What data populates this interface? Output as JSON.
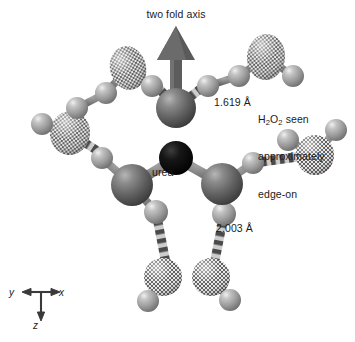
{
  "figure": {
    "kind": "molecular-structure-diagram",
    "background": "#ffffff",
    "labels": {
      "two_fold_axis": "two fold axis",
      "urea": "urea",
      "distance_o_h": "1.619 Å",
      "distance_n_h": "2.003 Å",
      "h2o2_note_line1_pre": "H",
      "h2o2_note_line1_sub1": "2",
      "h2o2_note_line1_mid": "O",
      "h2o2_note_line1_sub2": "2",
      "h2o2_note_line1_post": " seen",
      "h2o2_note_line2": "approximately",
      "h2o2_note_line3": "edge-on"
    },
    "axis_triad": {
      "x_label": "x",
      "y_label": "y",
      "z_label": "z"
    },
    "colors": {
      "atom_carbon": "#0a0a0a",
      "atom_heavy_dark": "#5a5a5a",
      "atom_hydrogen": "#9a9a9a",
      "atom_peroxide_oxygen": "#8d8d8d",
      "bond_solid": "#6e6e6e",
      "bond_dashed_dark": "#4f4f4f",
      "bond_dashed_light": "#c9c9c9",
      "arrow": "#5c5c5c",
      "text": "#1b1b1b"
    },
    "atoms": [
      {
        "id": "C1",
        "element": "C",
        "role": "urea-carbon",
        "style": "black",
        "cx": 176,
        "cy": 158,
        "r": 17
      },
      {
        "id": "O1",
        "element": "O",
        "role": "urea-oxygen",
        "style": "dark",
        "cx": 176,
        "cy": 108,
        "r": 20
      },
      {
        "id": "N1",
        "element": "N",
        "role": "urea-nitrogen-left",
        "style": "dark",
        "cx": 132,
        "cy": 185,
        "r": 21
      },
      {
        "id": "N2",
        "element": "N",
        "role": "urea-nitrogen-right",
        "style": "dark",
        "cx": 222,
        "cy": 184,
        "r": 21
      },
      {
        "id": "Op1a",
        "element": "O",
        "role": "peroxide-oxygen",
        "style": "checkered",
        "cx": 128,
        "cy": 68,
        "rx": 18,
        "ry": 22,
        "rot": -14
      },
      {
        "id": "Op1b",
        "element": "O",
        "role": "peroxide-oxygen",
        "style": "checkered",
        "cx": 70,
        "cy": 133,
        "rx": 20,
        "ry": 22,
        "rot": 8
      },
      {
        "id": "Op2a",
        "element": "O",
        "role": "peroxide-oxygen",
        "style": "checkered",
        "cx": 266,
        "cy": 57,
        "rx": 19,
        "ry": 23,
        "rot": 6
      },
      {
        "id": "Op3a",
        "element": "O",
        "role": "peroxide-oxygen",
        "style": "checkered",
        "cx": 315,
        "cy": 155,
        "rx": 19,
        "ry": 20,
        "rot": 0
      },
      {
        "id": "Op4a",
        "element": "O",
        "role": "peroxide-oxygen",
        "style": "checkered",
        "cx": 163,
        "cy": 277,
        "rx": 19,
        "ry": 19,
        "rot": 0
      },
      {
        "id": "Op4b",
        "element": "O",
        "role": "peroxide-oxygen",
        "style": "checkered",
        "cx": 211,
        "cy": 277,
        "rx": 19,
        "ry": 19,
        "rot": 0
      },
      {
        "id": "H1",
        "element": "H",
        "style": "light",
        "cx": 152,
        "cy": 86,
        "r": 11
      },
      {
        "id": "H2",
        "element": "H",
        "style": "light",
        "cx": 106,
        "cy": 93,
        "r": 11
      },
      {
        "id": "H3",
        "element": "H",
        "style": "light",
        "cx": 77,
        "cy": 108,
        "r": 11
      },
      {
        "id": "H4",
        "element": "H",
        "style": "light",
        "cx": 42,
        "cy": 124,
        "r": 11
      },
      {
        "id": "H5",
        "element": "H",
        "style": "light",
        "cx": 102,
        "cy": 158,
        "r": 11
      },
      {
        "id": "H6",
        "element": "H",
        "style": "light",
        "cx": 208,
        "cy": 86,
        "r": 11
      },
      {
        "id": "H7",
        "element": "H",
        "style": "light",
        "cx": 239,
        "cy": 76,
        "r": 11
      },
      {
        "id": "H8",
        "element": "H",
        "style": "light",
        "cx": 293,
        "cy": 76,
        "r": 11
      },
      {
        "id": "H9",
        "element": "H",
        "style": "light",
        "cx": 288,
        "cy": 140,
        "r": 11
      },
      {
        "id": "H10",
        "element": "H",
        "style": "light",
        "cx": 336,
        "cy": 130,
        "r": 11
      },
      {
        "id": "H11",
        "element": "H",
        "style": "light",
        "cx": 253,
        "cy": 163,
        "r": 11
      },
      {
        "id": "H12",
        "element": "H",
        "style": "light",
        "cx": 156,
        "cy": 212,
        "r": 12
      },
      {
        "id": "H13",
        "element": "H",
        "style": "light",
        "cx": 224,
        "cy": 214,
        "r": 12
      },
      {
        "id": "H14",
        "element": "H",
        "style": "light",
        "cx": 148,
        "cy": 301,
        "r": 11
      },
      {
        "id": "H15",
        "element": "H",
        "style": "light",
        "cx": 230,
        "cy": 300,
        "r": 11
      }
    ],
    "bonds": [
      {
        "from": "C1",
        "to": "O1",
        "type": "solid"
      },
      {
        "from": "C1",
        "to": "N1",
        "type": "solid"
      },
      {
        "from": "C1",
        "to": "N2",
        "type": "solid"
      },
      {
        "from": "N1",
        "to": "H5",
        "type": "solid"
      },
      {
        "from": "N1",
        "to": "H12",
        "type": "solid"
      },
      {
        "from": "N2",
        "to": "H11",
        "type": "solid"
      },
      {
        "from": "N2",
        "to": "H13",
        "type": "solid"
      },
      {
        "from": "O1",
        "to": "H1",
        "type": "dashed"
      },
      {
        "from": "O1",
        "to": "H6",
        "type": "dashed"
      },
      {
        "from": "H1",
        "to": "Op1a",
        "type": "solid"
      },
      {
        "from": "Op1a",
        "to": "H2",
        "type": "solid"
      },
      {
        "from": "H2",
        "to": "H3",
        "type": "solid"
      },
      {
        "from": "H3",
        "to": "Op1b",
        "type": "solid"
      },
      {
        "from": "Op1b",
        "to": "H4",
        "type": "solid"
      },
      {
        "from": "Op1b",
        "to": "H5",
        "type": "dashed"
      },
      {
        "from": "H6",
        "to": "H7",
        "type": "solid"
      },
      {
        "from": "H7",
        "to": "Op2a",
        "type": "solid"
      },
      {
        "from": "Op2a",
        "to": "H8",
        "type": "solid"
      },
      {
        "from": "H11",
        "to": "Op3a",
        "type": "dashed"
      },
      {
        "from": "Op3a",
        "to": "H9",
        "type": "solid"
      },
      {
        "from": "Op3a",
        "to": "H10",
        "type": "solid"
      },
      {
        "from": "H12",
        "to": "Op4a",
        "type": "dashed"
      },
      {
        "from": "H13",
        "to": "Op4b",
        "type": "dashed"
      },
      {
        "from": "Op4a",
        "to": "Op4b",
        "type": "solid"
      },
      {
        "from": "Op4a",
        "to": "H14",
        "type": "solid"
      },
      {
        "from": "Op4b",
        "to": "H15",
        "type": "solid"
      }
    ],
    "two_fold_axis_arrow": {
      "x": 176,
      "y_tail": 108,
      "y_head": 28
    }
  }
}
